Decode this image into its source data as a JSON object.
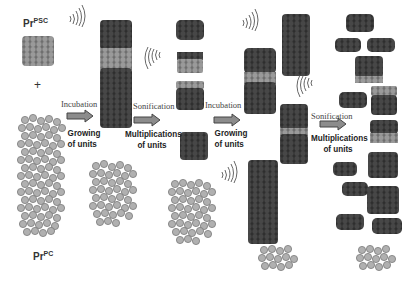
{
  "labels": {
    "prp_sc": {
      "base": "Pr",
      "sup": "PSC"
    },
    "prp_c": {
      "base": "Pr",
      "sup": "PC"
    },
    "plus": "+",
    "steps": [
      {
        "action": "Incubation",
        "result_line1": "Growing",
        "result_line2": "of units"
      },
      {
        "action": "Sonification",
        "result_line1": "Multiplications",
        "result_line2": "of units"
      },
      {
        "action": "Incubation",
        "result_line1": "Growing",
        "result_line2": "of units"
      },
      {
        "action": "Sonification",
        "result_line1": "Multiplications",
        "result_line2": "of units"
      }
    ]
  },
  "colors": {
    "dark_unit": "#3c3c3c",
    "light_unit": "#8a8a8a",
    "monomer": "#a8a8a8",
    "arrow_fill": "#8c8c8c",
    "arrow_stroke": "#444444",
    "background": "#ffffff"
  }
}
